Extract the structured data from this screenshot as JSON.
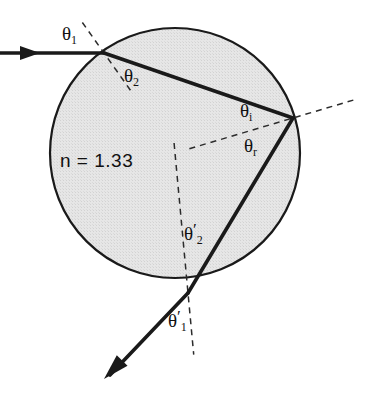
{
  "figure": {
    "kind": "optics-ray-diagram",
    "background_color": "#ffffff",
    "ray_color": "#1a1a1a",
    "normal_color": "#2b2b2b",
    "droplet_fill_color": "#e2e2e2",
    "droplet_stroke_color": "#1a1a1a"
  },
  "droplet": {
    "center_x": 175,
    "center_y": 153,
    "radius": 125,
    "medium_label": "n = 1.33"
  },
  "interaction_points": {
    "entry": {
      "x": 104,
      "y": 53
    },
    "internal_reflection": {
      "x": 293,
      "y": 118
    },
    "exit": {
      "x": 188,
      "y": 293
    }
  },
  "rays": {
    "incident_start": {
      "x": 0,
      "y": 53
    },
    "incident_arrow": {
      "x": 28,
      "y": 53
    },
    "exit_end": {
      "x": 104,
      "y": 379
    }
  },
  "labels": {
    "theta1": {
      "base": "θ",
      "sub": "1",
      "prime": ""
    },
    "theta2": {
      "base": "θ",
      "sub": "2",
      "prime": ""
    },
    "theta_i": {
      "base": "θ",
      "sub": "i",
      "prime": ""
    },
    "theta_r": {
      "base": "θ",
      "sub": "r",
      "prime": ""
    },
    "theta2_prime": {
      "base": "θ",
      "sub": "2",
      "prime": "′"
    },
    "theta1_prime": {
      "base": "θ",
      "sub": "1",
      "prime": "′"
    },
    "refractive_index": "n = 1.33"
  }
}
